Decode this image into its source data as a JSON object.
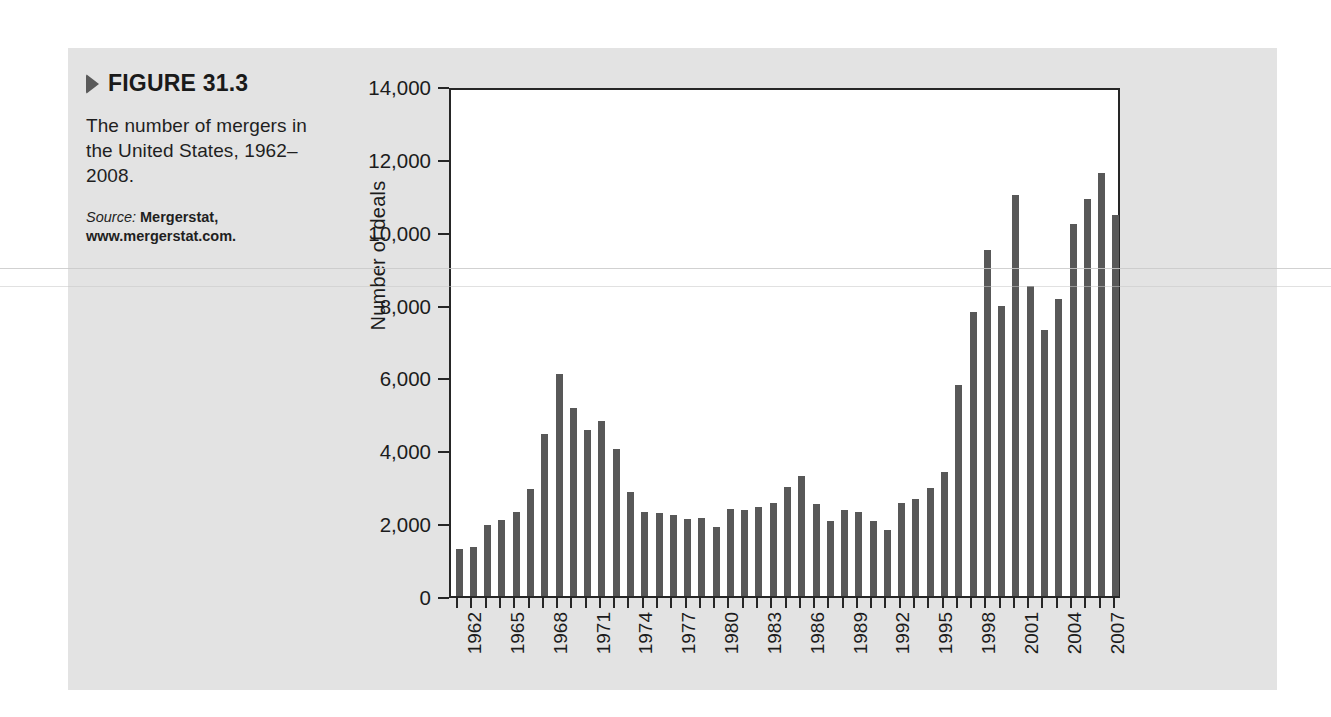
{
  "figure": {
    "marker_icon": "triangle-right-icon",
    "number": "FIGURE 31.3",
    "caption": "The number of mergers in the United States, 1962–2008.",
    "source_label": "Source:",
    "source_text": " Mergerstat, www.mergerstat.com."
  },
  "colors": {
    "panel_background": "#e3e3e3",
    "plot_background": "#ffffff",
    "bar_fill": "#585858",
    "axis": "#262626",
    "text": "#1c1c1c",
    "marker": "#5a5a5a"
  },
  "chart_data": {
    "type": "bar",
    "title": "The number of mergers in the United States, 1962–2008.",
    "xlabel": "",
    "ylabel": "Number of deals",
    "ylim": [
      0,
      14000
    ],
    "ytick_labels": [
      "14,000",
      "12,000",
      "10,000",
      "8,000",
      "6,000",
      "4,000",
      "2,000",
      "0"
    ],
    "ytick_values": [
      14000,
      12000,
      10000,
      8000,
      6000,
      4000,
      2000,
      0
    ],
    "xtick_labels": [
      "1962",
      "1965",
      "1968",
      "1971",
      "1974",
      "1977",
      "1980",
      "1983",
      "1986",
      "1989",
      "1992",
      "1995",
      "1998",
      "2001",
      "2004",
      "2007"
    ],
    "xtick_years": [
      1962,
      1965,
      1968,
      1971,
      1974,
      1977,
      1980,
      1983,
      1986,
      1989,
      1992,
      1995,
      1998,
      2001,
      2004,
      2007
    ],
    "grid": false,
    "legend": null,
    "categories": [
      1962,
      1963,
      1964,
      1965,
      1966,
      1967,
      1968,
      1969,
      1970,
      1971,
      1972,
      1973,
      1974,
      1975,
      1976,
      1977,
      1978,
      1979,
      1980,
      1981,
      1982,
      1983,
      1984,
      1985,
      1986,
      1987,
      1988,
      1989,
      1990,
      1991,
      1992,
      1993,
      1994,
      1995,
      1996,
      1997,
      1998,
      1999,
      2000,
      2001,
      2002,
      2003,
      2004,
      2005,
      2006,
      2007,
      2008
    ],
    "values": [
      1300,
      1350,
      1950,
      2100,
      2300,
      2950,
      4450,
      6100,
      5150,
      4550,
      4800,
      4040,
      2860,
      2300,
      2280,
      2220,
      2110,
      2130,
      1890,
      2400,
      2350,
      2430,
      2540,
      3000,
      3300,
      2530,
      2050,
      2370,
      2300,
      2050,
      1800,
      2550,
      2660,
      2970,
      3410,
      5800,
      7800,
      9500,
      7950,
      11000,
      8500,
      7300,
      8150,
      10200,
      10900,
      11600,
      10450
    ],
    "series_name": "Number of deals"
  }
}
